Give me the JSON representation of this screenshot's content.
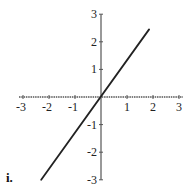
{
  "chart_data": {
    "type": "line",
    "title": "",
    "panel_label": "i.",
    "xlabel": "",
    "ylabel": "",
    "xlim": [
      -3,
      3
    ],
    "ylim": [
      -3,
      3
    ],
    "grid": false,
    "x_ticks": [
      -3,
      -2,
      -1,
      1,
      2,
      3
    ],
    "y_ticks": [
      3,
      2,
      1,
      -1,
      -2,
      -3
    ],
    "x_tick_labels": [
      "-3",
      "-2",
      "-1",
      "1",
      "2",
      "3"
    ],
    "y_tick_labels": [
      "3",
      "2",
      "1",
      "-1",
      "-2",
      "-3"
    ],
    "series": [
      {
        "name": "line",
        "x": [
          -2.3,
          1.85
        ],
        "y": [
          -3.0,
          2.45
        ],
        "color": "#222222"
      }
    ]
  },
  "colors": {
    "axis": "#555555",
    "line": "#222222",
    "text": "#222222"
  }
}
